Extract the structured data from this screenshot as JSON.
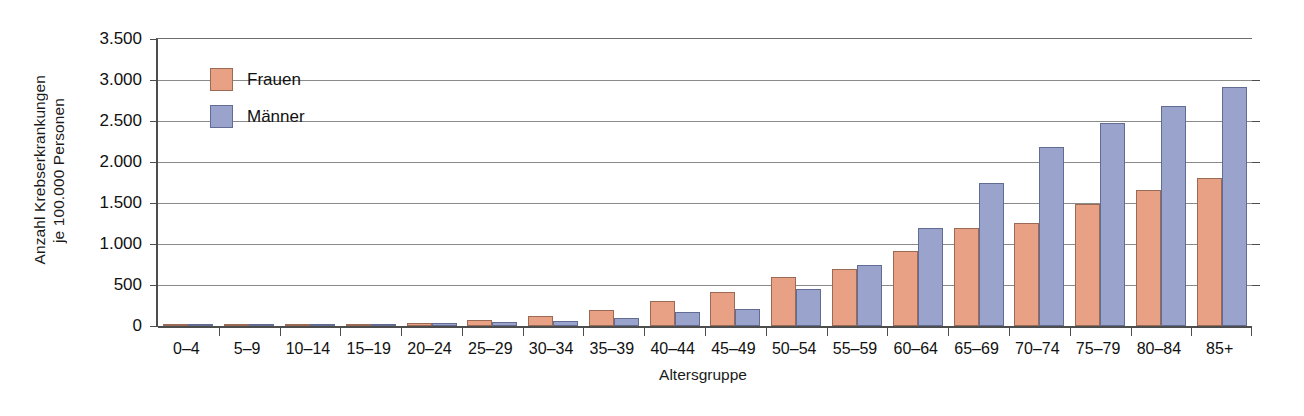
{
  "chart_data": {
    "type": "bar",
    "title": "",
    "subtitle": "",
    "xlabel": "Altersgruppe",
    "ylabel": "Anzahl Krebserkrankungen je 100.000 Personen",
    "ylabel_lines": [
      "Anzahl Krebserkrankungen",
      "je 100.000 Personen"
    ],
    "ylim": [
      0,
      3500
    ],
    "ytick_values": [
      0,
      500,
      1000,
      1500,
      2000,
      2500,
      3000,
      3500
    ],
    "ytick_labels": [
      "0",
      "500",
      "1.000",
      "1.500",
      "2.000",
      "2.500",
      "3.000",
      "3.500"
    ],
    "grid": true,
    "grid_axis": "y",
    "legend_position": "upper-left-inside",
    "categories": [
      "0–4",
      "5–9",
      "10–14",
      "15–19",
      "20–24",
      "25–29",
      "30–34",
      "35–39",
      "40–44",
      "45–49",
      "50–54",
      "55–59",
      "60–64",
      "65–69",
      "70–74",
      "75–79",
      "80–84",
      "85+"
    ],
    "series": [
      {
        "name": "Frauen",
        "color": "#e8a184",
        "values": [
          20,
          15,
          15,
          20,
          35,
          70,
          120,
          190,
          300,
          410,
          600,
          690,
          920,
          1190,
          1260,
          1490,
          1655,
          1800
        ]
      },
      {
        "name": "Männer",
        "color": "#99a3cb",
        "values": [
          25,
          20,
          20,
          25,
          40,
          55,
          65,
          95,
          165,
          205,
          455,
          750,
          1195,
          1745,
          2185,
          2480,
          2680,
          2915
        ]
      }
    ]
  },
  "legend": {
    "items": [
      {
        "label": "Frauen",
        "color": "#e8a184"
      },
      {
        "label": "Männer",
        "color": "#99a3cb"
      }
    ]
  },
  "colors": {
    "frauen": "#e8a184",
    "maenner": "#99a3cb",
    "axis": "#4d4d4d",
    "grid": "#8a8a8a",
    "background": "#ffffff"
  }
}
